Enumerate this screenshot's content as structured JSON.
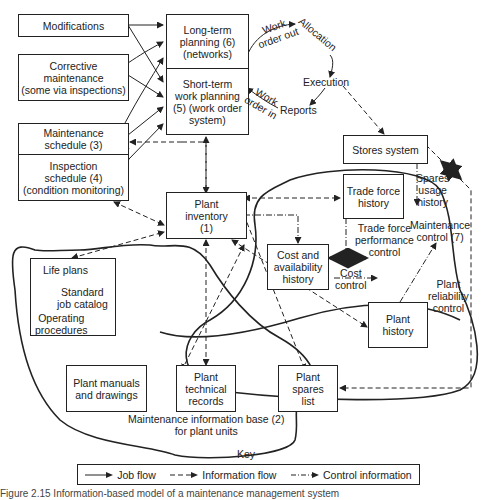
{
  "boxes": {
    "modifications": "Modifications",
    "corrective": "Corrective\nmaintenance\n(some via inspections)",
    "maint_schedule": "Maintenance\nschedule (3)",
    "inspection_schedule": "Inspection\nschedule (4)\n(condition monitoring)",
    "long_term": "Long-term\nplanning (6)\n(networks)",
    "short_term": "Short-term\nwork planning\n(5) (work order\nsystem)",
    "plant_inventory": "Plant\ninventory\n(1)",
    "stores": "Stores system",
    "trade_force": "Trade force\nhistory",
    "cost_avail": "Cost and\navailability\nhistory",
    "plant_history": "Plant\nhistory",
    "life_plans_box": "",
    "manuals": "Plant manuals\nand drawings",
    "technical": "Plant\ntechnical\nrecords",
    "spares": "Plant\nspares\nlist"
  },
  "labels": {
    "work_order_out": "Work\norder out",
    "allocation": "Allocation",
    "execution": "Execution",
    "reports": "Reports",
    "work_order_in": "Work\norder in",
    "spares_usage": "Spares\nusage\nhistory",
    "maint_control": "Maintenance\ncontrol (7)",
    "trade_perf": "Trade force\nperformance\ncontrol",
    "cost_control": "Cost\ncontrol",
    "reliability": "Plant\nreliability\ncontrol",
    "life_plans": "Life plans",
    "std_job": "Standard\njob catalog",
    "operating": "Operating\nprocedures",
    "info_base": "Maintenance information base (2)\nfor plant units"
  },
  "key": {
    "title": "Key",
    "job_flow": "Job flow",
    "info_flow": "Information flow",
    "control_info": "Control information"
  },
  "caption": "Figure 2.15  Information-based model of a maintenance management system"
}
